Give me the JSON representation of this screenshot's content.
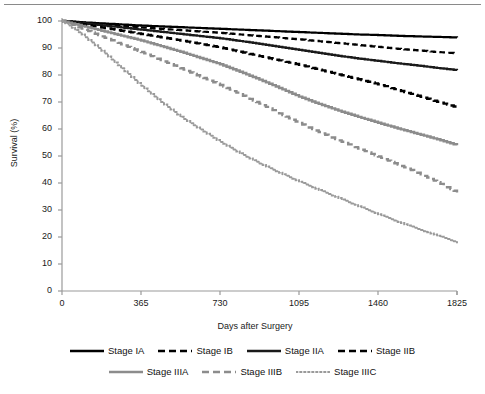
{
  "figure": {
    "name": "kaplan-meier-survival-by-stage",
    "has_top_rule": true
  },
  "chart_data": {
    "type": "line",
    "title": "",
    "subtitle": "",
    "xlabel": "Days after Surgery",
    "ylabel": "Survival (%)",
    "xlim": [
      0,
      1825
    ],
    "ylim": [
      0,
      100
    ],
    "xticks": [
      0,
      365,
      730,
      1095,
      1460,
      1825
    ],
    "xtick_labels": [
      "0",
      "365",
      "730",
      "1095",
      "1460",
      "1825"
    ],
    "yticks": [
      0,
      10,
      20,
      30,
      40,
      50,
      60,
      70,
      80,
      90,
      100
    ],
    "ytick_labels": [
      "0",
      "10",
      "20",
      "30",
      "40",
      "50",
      "60",
      "70",
      "80",
      "90",
      "100"
    ],
    "grid": false,
    "legend_position": "bottom",
    "x": [
      0,
      91,
      182,
      273,
      365,
      456,
      547,
      638,
      730,
      821,
      912,
      1003,
      1095,
      1186,
      1277,
      1368,
      1460,
      1551,
      1642,
      1733,
      1825
    ],
    "series": [
      {
        "name": "Stage IA",
        "color": "#000000",
        "style": "solid",
        "width": 2.2,
        "values": [
          100,
          99.5,
          99.1,
          98.7,
          98.3,
          98.0,
          97.7,
          97.4,
          97.1,
          96.8,
          96.5,
          96.2,
          95.9,
          95.6,
          95.3,
          95.0,
          94.8,
          94.5,
          94.3,
          94.1,
          93.9
        ]
      },
      {
        "name": "Stage IB",
        "color": "#000000",
        "style": "dashed",
        "width": 2.2,
        "values": [
          100,
          99.4,
          98.8,
          98.2,
          97.6,
          97.1,
          96.6,
          96.1,
          95.6,
          95.0,
          94.4,
          93.8,
          93.2,
          92.5,
          91.8,
          91.1,
          90.4,
          89.7,
          89.1,
          88.5,
          88.0
        ]
      },
      {
        "name": "Stage IIA",
        "color": "#1a1a1a",
        "style": "solid",
        "width": 2.2,
        "values": [
          100,
          99.2,
          98.4,
          97.6,
          96.8,
          96.0,
          95.2,
          94.4,
          93.6,
          92.6,
          91.5,
          90.4,
          89.3,
          88.2,
          87.1,
          86.1,
          85.2,
          84.3,
          83.5,
          82.6,
          81.8
        ]
      },
      {
        "name": "Stage IIB",
        "color": "#000000",
        "style": "dashed",
        "width": 2.4,
        "values": [
          100,
          98.8,
          97.6,
          96.4,
          95.2,
          94.0,
          92.8,
          91.5,
          90.2,
          88.6,
          87.0,
          85.4,
          83.8,
          82.0,
          80.2,
          78.4,
          76.6,
          74.4,
          72.3,
          70.1,
          68.0
        ]
      },
      {
        "name": "Stage IIIA",
        "color": "#8c8c8c",
        "style": "solid",
        "width": 2.4,
        "values": [
          100,
          98.2,
          96.4,
          94.6,
          92.8,
          90.7,
          88.6,
          86.3,
          84.0,
          81.2,
          78.3,
          75.2,
          72.0,
          69.3,
          66.8,
          64.5,
          62.3,
          60.2,
          58.2,
          56.2,
          54.0
        ]
      },
      {
        "name": "Stage IIIB",
        "color": "#8c8c8c",
        "style": "dashed",
        "width": 2.4,
        "values": [
          100,
          97.2,
          94.3,
          91.4,
          88.5,
          85.5,
          82.5,
          79.4,
          76.3,
          72.9,
          69.4,
          65.8,
          62.2,
          58.9,
          55.8,
          52.8,
          49.8,
          46.8,
          43.8,
          40.3,
          36.5
        ]
      },
      {
        "name": "Stage IIIC",
        "color": "#9a9a9a",
        "style": "dotted",
        "width": 2.0,
        "values": [
          100,
          95.0,
          89.0,
          82.5,
          76.0,
          70.0,
          64.5,
          59.8,
          55.2,
          51.0,
          47.2,
          43.8,
          40.5,
          37.4,
          34.4,
          31.4,
          28.4,
          25.6,
          23.0,
          20.5,
          18.0
        ]
      }
    ]
  },
  "legend": {
    "rows": [
      [
        {
          "label": "Stage IA",
          "color": "#000000",
          "style": "solid"
        },
        {
          "label": "Stage IB",
          "color": "#000000",
          "style": "dashed"
        },
        {
          "label": "Stage IIA",
          "color": "#1a1a1a",
          "style": "solid"
        },
        {
          "label": "Stage IIB",
          "color": "#000000",
          "style": "dashed"
        }
      ],
      [
        {
          "label": "Stage IIIA",
          "color": "#8c8c8c",
          "style": "solid"
        },
        {
          "label": "Stage IIIB",
          "color": "#8c8c8c",
          "style": "dashed"
        },
        {
          "label": "Stage IIIC",
          "color": "#9a9a9a",
          "style": "dotted"
        }
      ]
    ]
  },
  "axis_colors": {
    "axis_line": "#9a9a9a",
    "tick_text": "#1a1a1a",
    "top_rule": "#8a8a8a"
  }
}
